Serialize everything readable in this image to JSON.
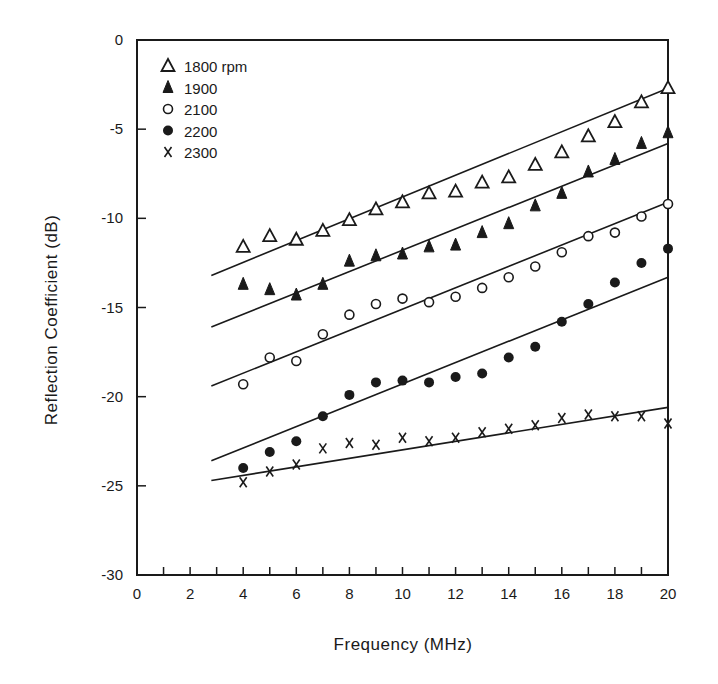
{
  "chart_data": {
    "type": "scatter",
    "title": "",
    "xlabel": "Frequency (MHz)",
    "ylabel": "Reflection Coefficient (dB)",
    "xlim": [
      0,
      20
    ],
    "ylim": [
      -30,
      0
    ],
    "x_ticks": [
      0,
      2,
      4,
      6,
      8,
      10,
      12,
      14,
      16,
      18,
      20
    ],
    "x_minor_step": 1,
    "y_ticks": [
      0,
      -5,
      -10,
      -15,
      -20,
      -25,
      -30
    ],
    "grid": false,
    "legend_position": "upper-left-inside",
    "series": [
      {
        "name": "1800 rpm",
        "marker": "open-triangle",
        "x": [
          4,
          5,
          6,
          7,
          8,
          9,
          10,
          11,
          12,
          13,
          14,
          15,
          16,
          17,
          18,
          19,
          20
        ],
        "values": [
          -11.6,
          -11.0,
          -11.2,
          -10.7,
          -10.1,
          -9.5,
          -9.1,
          -8.6,
          -8.5,
          -8.0,
          -7.7,
          -7.0,
          -6.3,
          -5.4,
          -4.6,
          -3.5,
          -2.7
        ],
        "fit_line": {
          "x": [
            2.8,
            20
          ],
          "y": [
            -13.2,
            -2.7
          ]
        }
      },
      {
        "name": "1900",
        "marker": "filled-triangle",
        "x": [
          4,
          5,
          6,
          7,
          8,
          9,
          10,
          11,
          12,
          13,
          14,
          15,
          16,
          17,
          18,
          19,
          20
        ],
        "values": [
          -13.7,
          -14.0,
          -14.3,
          -13.7,
          -12.4,
          -12.1,
          -12.0,
          -11.6,
          -11.5,
          -10.8,
          -10.3,
          -9.3,
          -8.6,
          -7.4,
          -6.7,
          -5.8,
          -5.2
        ],
        "fit_line": {
          "x": [
            2.8,
            20
          ],
          "y": [
            -16.1,
            -5.8
          ]
        }
      },
      {
        "name": "2100",
        "marker": "open-circle",
        "x": [
          4,
          5,
          6,
          7,
          8,
          9,
          10,
          11,
          12,
          13,
          14,
          15,
          16,
          17,
          18,
          19,
          20
        ],
        "values": [
          -19.3,
          -17.8,
          -18.0,
          -16.5,
          -15.4,
          -14.8,
          -14.5,
          -14.7,
          -14.4,
          -13.9,
          -13.3,
          -12.7,
          -11.9,
          -11.0,
          -10.8,
          -9.9,
          -9.2
        ],
        "fit_line": {
          "x": [
            2.8,
            20
          ],
          "y": [
            -19.4,
            -9.1
          ]
        }
      },
      {
        "name": "2200",
        "marker": "filled-circle",
        "x": [
          4,
          5,
          6,
          7,
          8,
          9,
          10,
          11,
          12,
          13,
          14,
          15,
          16,
          17,
          18,
          19,
          20
        ],
        "values": [
          -24.0,
          -23.1,
          -22.5,
          -21.1,
          -19.9,
          -19.2,
          -19.1,
          -19.2,
          -18.9,
          -18.7,
          -17.8,
          -17.2,
          -15.8,
          -14.8,
          -13.6,
          -12.5,
          -11.7
        ],
        "fit_line": {
          "x": [
            2.8,
            20
          ],
          "y": [
            -23.6,
            -13.3
          ]
        }
      },
      {
        "name": "2300",
        "marker": "x",
        "x": [
          4,
          5,
          6,
          7,
          8,
          9,
          10,
          11,
          12,
          13,
          14,
          15,
          16,
          17,
          18,
          19,
          20
        ],
        "values": [
          -24.8,
          -24.2,
          -23.8,
          -22.9,
          -22.6,
          -22.7,
          -22.3,
          -22.5,
          -22.3,
          -22.0,
          -21.8,
          -21.6,
          -21.2,
          -21.0,
          -21.1,
          -21.1,
          -21.5
        ],
        "fit_line": {
          "x": [
            2.8,
            20
          ],
          "y": [
            -24.7,
            -20.6
          ]
        }
      }
    ]
  },
  "legend": {
    "items": [
      {
        "symbol": "△",
        "label": "1800 rpm"
      },
      {
        "symbol": "▲",
        "label": "1900"
      },
      {
        "symbol": "○",
        "label": "2100"
      },
      {
        "symbol": "●",
        "label": "2200"
      },
      {
        "symbol": "x",
        "label": "2300"
      }
    ]
  },
  "axes": {
    "x_title": "Frequency (MHz)",
    "y_title": "Reflection Coefficient (dB)"
  },
  "colors": {
    "ink": "#1a1a1a",
    "background": "#ffffff"
  }
}
